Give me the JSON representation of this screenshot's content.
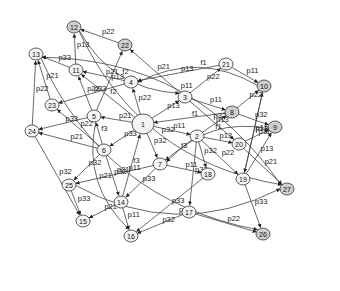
{
  "diagram": {
    "type": "directed-graph",
    "nodes": [
      {
        "id": "1",
        "x": 143,
        "y": 124,
        "r": 10,
        "dark": false
      },
      {
        "id": "2",
        "x": 197,
        "y": 136,
        "r": 6,
        "dark": false
      },
      {
        "id": "3",
        "x": 185,
        "y": 97,
        "r": 6,
        "dark": false
      },
      {
        "id": "4",
        "x": 131,
        "y": 82,
        "r": 6,
        "dark": false
      },
      {
        "id": "5",
        "x": 94,
        "y": 116,
        "r": 6,
        "dark": false
      },
      {
        "id": "6",
        "x": 104,
        "y": 150,
        "r": 6,
        "dark": false
      },
      {
        "id": "7",
        "x": 160,
        "y": 164,
        "r": 6,
        "dark": false
      },
      {
        "id": "8",
        "x": 232,
        "y": 112,
        "r": 6,
        "dark": true
      },
      {
        "id": "9",
        "x": 275,
        "y": 127,
        "r": 6,
        "dark": true
      },
      {
        "id": "10",
        "x": 264,
        "y": 86,
        "r": 6,
        "dark": true
      },
      {
        "id": "11",
        "x": 76,
        "y": 70,
        "r": 6,
        "dark": false
      },
      {
        "id": "12",
        "x": 74,
        "y": 27,
        "r": 6,
        "dark": true
      },
      {
        "id": "13",
        "x": 36,
        "y": 54,
        "r": 6,
        "dark": false
      },
      {
        "id": "14",
        "x": 121,
        "y": 202,
        "r": 6,
        "dark": false
      },
      {
        "id": "15",
        "x": 83,
        "y": 221,
        "r": 6,
        "dark": false
      },
      {
        "id": "16",
        "x": 131,
        "y": 236,
        "r": 6,
        "dark": false
      },
      {
        "id": "17",
        "x": 189,
        "y": 212,
        "r": 6,
        "dark": false
      },
      {
        "id": "18",
        "x": 208,
        "y": 174,
        "r": 6,
        "dark": false
      },
      {
        "id": "19",
        "x": 243,
        "y": 179,
        "r": 6,
        "dark": false
      },
      {
        "id": "20",
        "x": 239,
        "y": 144,
        "r": 6,
        "dark": false
      },
      {
        "id": "21",
        "x": 226,
        "y": 64,
        "r": 6,
        "dark": false
      },
      {
        "id": "22",
        "x": 125,
        "y": 45,
        "r": 6,
        "dark": true
      },
      {
        "id": "23",
        "x": 52,
        "y": 105,
        "r": 6,
        "dark": false
      },
      {
        "id": "24",
        "x": 32,
        "y": 131,
        "r": 6,
        "dark": false
      },
      {
        "id": "25",
        "x": 69,
        "y": 185,
        "r": 6,
        "dark": false
      },
      {
        "id": "26",
        "x": 263,
        "y": 234,
        "r": 6,
        "dark": true
      },
      {
        "id": "27",
        "x": 287,
        "y": 189,
        "r": 6,
        "dark": true
      }
    ],
    "edges": [
      {
        "from": "1",
        "to": "5",
        "label": "p21"
      },
      {
        "from": "1",
        "to": "4",
        "label": "p22"
      },
      {
        "from": "1",
        "to": "11",
        "label": "f2"
      },
      {
        "from": "1",
        "to": "3",
        "label": "p13"
      },
      {
        "from": "1",
        "to": "2",
        "label": "p11"
      },
      {
        "from": "1",
        "to": "6",
        "label": "p33"
      },
      {
        "from": "1",
        "to": "7",
        "label": "p32"
      },
      {
        "from": "14",
        "to": "1",
        "label": "f3"
      },
      {
        "from": "3",
        "to": "21",
        "label": "p22"
      },
      {
        "from": "3",
        "to": "8",
        "label": "p11"
      },
      {
        "from": "3",
        "to": "22",
        "label": "p21"
      },
      {
        "from": "3",
        "to": "20",
        "label": "p32"
      },
      {
        "from": "10",
        "to": "4",
        "label": "f1"
      },
      {
        "from": "21",
        "to": "4",
        "label": "p13"
      },
      {
        "from": "21",
        "to": "10",
        "label": "p11"
      },
      {
        "from": "4",
        "to": "11",
        "label": "p21"
      },
      {
        "from": "4",
        "to": "23",
        "label": "p33"
      },
      {
        "from": "22",
        "to": "12",
        "label": "p22"
      },
      {
        "from": "11",
        "to": "12",
        "label": "p13"
      },
      {
        "from": "11",
        "to": "13",
        "label": "p33"
      },
      {
        "from": "5",
        "to": "22",
        "label": "p13"
      },
      {
        "from": "5",
        "to": "11",
        "label": "p22"
      },
      {
        "from": "5",
        "to": "24",
        "label": "p33"
      },
      {
        "from": "6",
        "to": "5",
        "label": "f3"
      },
      {
        "from": "6",
        "to": "23",
        "label": "p22"
      },
      {
        "from": "6",
        "to": "24",
        "label": "p21"
      },
      {
        "from": "6",
        "to": "25",
        "label": "p32"
      },
      {
        "from": "6",
        "to": "14",
        "label": "p32"
      },
      {
        "from": "23",
        "to": "13",
        "label": "p21"
      },
      {
        "from": "24",
        "to": "13",
        "label": "p22"
      },
      {
        "from": "8",
        "to": "1",
        "label": "f1"
      },
      {
        "from": "8",
        "to": "10",
        "label": "p22"
      },
      {
        "from": "8",
        "to": "9",
        "label": "p32"
      },
      {
        "from": "2",
        "to": "8",
        "label": "p13"
      },
      {
        "from": "2",
        "to": "7",
        "label": "f3"
      },
      {
        "from": "2",
        "to": "18",
        "label": "p32"
      },
      {
        "from": "2",
        "to": "19",
        "label": "p22"
      },
      {
        "from": "2",
        "to": "20",
        "label": "p13"
      },
      {
        "from": "20",
        "to": "9",
        "label": "p11"
      },
      {
        "from": "19",
        "to": "10",
        "label": "p13"
      },
      {
        "from": "19",
        "to": "9",
        "label": "p13"
      },
      {
        "from": "9",
        "to": "7",
        "label": "f1"
      },
      {
        "from": "7",
        "to": "25",
        "label": "p21"
      },
      {
        "from": "7",
        "to": "18",
        "label": "p11"
      },
      {
        "from": "7",
        "to": "14",
        "label": "p33"
      },
      {
        "from": "14",
        "to": "15",
        "label": "p21"
      },
      {
        "from": "14",
        "to": "16",
        "label": "p11"
      },
      {
        "from": "17",
        "to": "16",
        "label": "p32"
      },
      {
        "from": "2",
        "to": "17",
        "label": "p33"
      },
      {
        "from": "18",
        "to": "16",
        "label": "p33"
      },
      {
        "from": "25",
        "to": "15",
        "label": "p33"
      },
      {
        "from": "24",
        "to": "15",
        "label": "p32"
      },
      {
        "from": "17",
        "to": "26",
        "label": "p22"
      },
      {
        "from": "19",
        "to": "26",
        "label": "p33"
      },
      {
        "from": "20",
        "to": "27",
        "label": "p21"
      },
      {
        "from": "27",
        "to": "13",
        "label": "p11"
      },
      {
        "from": "12",
        "to": "27",
        "label": "p32"
      },
      {
        "from": "12",
        "to": "3",
        "label": "f2"
      },
      {
        "from": "10",
        "to": "19",
        "label": "p11"
      },
      {
        "from": "25",
        "to": "27",
        "label": "p13"
      },
      {
        "from": "13",
        "to": "26",
        "label": "p11"
      },
      {
        "from": "5",
        "to": "16",
        "label": "p21"
      }
    ]
  }
}
